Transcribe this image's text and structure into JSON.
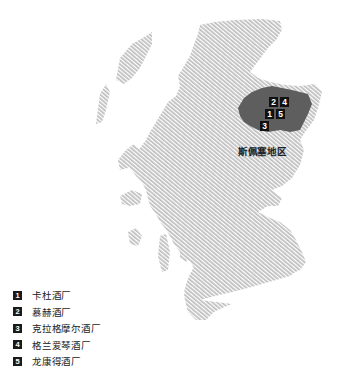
{
  "map": {
    "title": "Scotland",
    "highlight_region": {
      "label": "斯佩塞地区",
      "fill": "#5e5e5e"
    },
    "land_color": "#c8c8c8",
    "badges": [
      {
        "num": "2",
        "x": 269,
        "y": 97
      },
      {
        "num": "4",
        "x": 280,
        "y": 97
      },
      {
        "num": "1",
        "x": 265,
        "y": 109
      },
      {
        "num": "5",
        "x": 276,
        "y": 109
      },
      {
        "num": "3",
        "x": 260,
        "y": 121
      }
    ]
  },
  "legend": {
    "items": [
      {
        "num": "1",
        "label": "卡杜酒厂"
      },
      {
        "num": "2",
        "label": "慕赫酒厂"
      },
      {
        "num": "3",
        "label": "克拉格摩尔酒厂"
      },
      {
        "num": "4",
        "label": "格兰爱琴酒厂"
      },
      {
        "num": "5",
        "label": "龙康得酒厂"
      }
    ]
  }
}
